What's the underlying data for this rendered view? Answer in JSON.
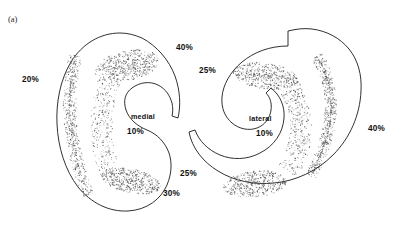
{
  "figure": {
    "panel_label": "(a)",
    "background_color": "#ffffff",
    "ink_color": "#1a1a1a",
    "stipple_color": "#4a4a4a"
  },
  "chart_data": {
    "type": "diagram",
    "title": "",
    "subtitle": "",
    "xlabel": "",
    "ylabel": "",
    "shapes": [
      {
        "id": "left-section",
        "orientation": "opens-right",
        "center_label": "medial",
        "center_value": "10%",
        "margin_labels": [
          {
            "label": "20%",
            "position": "left"
          },
          {
            "label": "40%",
            "position": "top-right"
          },
          {
            "label": "10%",
            "position": "inner-concavity"
          },
          {
            "label": "30%",
            "position": "bottom-right"
          }
        ]
      },
      {
        "id": "right-section",
        "orientation": "opens-left",
        "center_label": "lateral",
        "center_value": "10%",
        "margin_labels": [
          {
            "label": "25%",
            "position": "top-left"
          },
          {
            "label": "10%",
            "position": "inner-concavity"
          },
          {
            "label": "40%",
            "position": "right"
          },
          {
            "label": "25%",
            "position": "bottom-left"
          }
        ]
      }
    ],
    "legend": [],
    "annotations": [
      "(a)",
      "medial",
      "lateral"
    ]
  },
  "left_section": {
    "name": "medial",
    "label_medial": "medial",
    "label_20": "20%",
    "label_40": "40%",
    "label_10": "10%",
    "label_30": "30%"
  },
  "right_section": {
    "name": "lateral",
    "label_lateral": "lateral",
    "label_25_top": "25%",
    "label_10": "10%",
    "label_40": "40%",
    "label_25_bottom": "25%"
  }
}
